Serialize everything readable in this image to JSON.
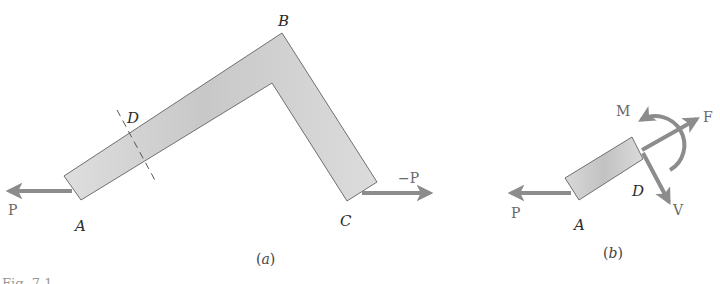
{
  "figure": {
    "caption": "Fig. 7.1",
    "colors": {
      "member_fill": "#d9d9d9",
      "member_fill_dark": "#c4c4c4",
      "member_stroke": "#6f6f6f",
      "arrow": "#8c8c8c",
      "background": "#ffffff"
    },
    "panel_a": {
      "label": "(a)",
      "points": {
        "A": "A",
        "B": "B",
        "C": "C",
        "D": "D"
      },
      "forces": {
        "left": "P",
        "right": "−P"
      }
    },
    "panel_b": {
      "label": "(b)",
      "points": {
        "A": "A",
        "D": "D"
      },
      "forces": {
        "P": "P",
        "F": "F",
        "V": "V",
        "M": "M"
      }
    }
  }
}
